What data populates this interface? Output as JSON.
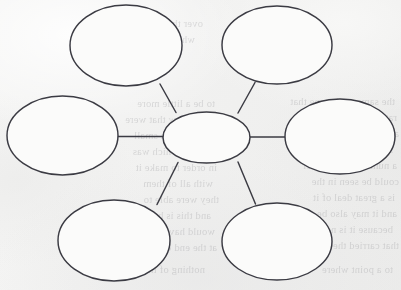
{
  "document": {
    "kind": "concept-map-worksheet",
    "title": "Blank concept map",
    "medium": "scanned paper",
    "paper_color": "#f3f3f2",
    "ink_color": "#3b3b43",
    "bubble_fill": "#fbfbfa",
    "node_count": 7,
    "connector_count": 6
  },
  "diagram": {
    "type": "hub-and-spoke concept map",
    "hub": {
      "id": "center",
      "label": "",
      "cx": 206.5,
      "cy": 137.5,
      "rx": 43.5,
      "ry": 25.5
    },
    "nodes": [
      {
        "id": "top-left",
        "label": "",
        "cx": 126.0,
        "cy": 45.5,
        "rx": 56.0,
        "ry": 40.5
      },
      {
        "id": "top-right",
        "label": "",
        "cx": 277.0,
        "cy": 45.0,
        "rx": 55.0,
        "ry": 39.0
      },
      {
        "id": "middle-left",
        "label": "",
        "cx": 62.5,
        "cy": 135.5,
        "rx": 55.5,
        "ry": 39.5
      },
      {
        "id": "middle-right",
        "label": "",
        "cx": 340.0,
        "cy": 136.5,
        "rx": 55.0,
        "ry": 37.5
      },
      {
        "id": "bottom-left",
        "label": "",
        "cx": 114.0,
        "cy": 240.5,
        "rx": 56.0,
        "ry": 40.5
      },
      {
        "id": "bottom-right",
        "label": "",
        "cx": 277.0,
        "cy": 241.5,
        "rx": 55.0,
        "ry": 38.5
      }
    ],
    "connectors": [
      {
        "id": "hub-to-top-left",
        "from": "center",
        "to": "top-left",
        "x1": 176.0,
        "y1": 112.5,
        "x2": 160.0,
        "y2": 84.0
      },
      {
        "id": "hub-to-top-right",
        "from": "center",
        "to": "top-right",
        "x1": 238.0,
        "y1": 113.0,
        "x2": 255.0,
        "y2": 82.5
      },
      {
        "id": "hub-to-middle-left",
        "from": "center",
        "to": "middle-left",
        "x1": 163.0,
        "y1": 136.5,
        "x2": 118.0,
        "y2": 136.5
      },
      {
        "id": "hub-to-middle-right",
        "from": "center",
        "to": "middle-right",
        "x1": 250.0,
        "y1": 137.0,
        "x2": 287.0,
        "y2": 137.0
      },
      {
        "id": "hub-to-bottom-left",
        "from": "center",
        "to": "bottom-left",
        "x1": 178.0,
        "y1": 162.5,
        "x2": 157.0,
        "y2": 204.5
      },
      {
        "id": "hub-to-bottom-right",
        "from": "center",
        "to": "bottom-right",
        "x1": 238.0,
        "y1": 162.0,
        "x2": 255.5,
        "y2": 204.0
      }
    ]
  },
  "bleed_through": {
    "note": "Faint reversed text showing through from the other side of the page; illegible.",
    "lines": [
      {
        "x": 6,
        "y": 94,
        "text": "the same as the one that"
      },
      {
        "x": 4,
        "y": 110,
        "text": "rather than the amount"
      },
      {
        "x": 2,
        "y": 126,
        "text": "and was used to"
      },
      {
        "x": 8,
        "y": 142,
        "text": "since the time when"
      },
      {
        "x": 4,
        "y": 158,
        "text": "a number of the other"
      },
      {
        "x": 2,
        "y": 174,
        "text": "could be seen in the"
      },
      {
        "x": 6,
        "y": 190,
        "text": "is a great deal of it"
      },
      {
        "x": 4,
        "y": 206,
        "text": "and it may also be"
      },
      {
        "x": 8,
        "y": 222,
        "text": "because it is not"
      },
      {
        "x": 2,
        "y": 238,
        "text": "that carried the"
      },
      {
        "x": 186,
        "y": 96,
        "text": "to be a little more"
      },
      {
        "x": 188,
        "y": 112,
        "text": "of the few that were"
      },
      {
        "x": 182,
        "y": 128,
        "text": "and there is a small"
      },
      {
        "x": 190,
        "y": 144,
        "text": "part of which was"
      },
      {
        "x": 184,
        "y": 160,
        "text": "in order to make it"
      },
      {
        "x": 188,
        "y": 176,
        "text": "with all of them"
      },
      {
        "x": 182,
        "y": 192,
        "text": "they were able to"
      },
      {
        "x": 190,
        "y": 208,
        "text": "and this is how the"
      },
      {
        "x": 186,
        "y": 224,
        "text": "would have been"
      },
      {
        "x": 184,
        "y": 240,
        "text": "at the end of it"
      },
      {
        "x": 198,
        "y": 16,
        "text": "over the course of"
      },
      {
        "x": 206,
        "y": 32,
        "text": "which was given"
      },
      {
        "x": 8,
        "y": 262,
        "text": "to a point where"
      },
      {
        "x": 196,
        "y": 262,
        "text": "nothing of the kind"
      },
      {
        "x": 288,
        "y": 118,
        "text": "one of these"
      },
      {
        "x": 292,
        "y": 140,
        "text": "and it was so"
      }
    ]
  }
}
